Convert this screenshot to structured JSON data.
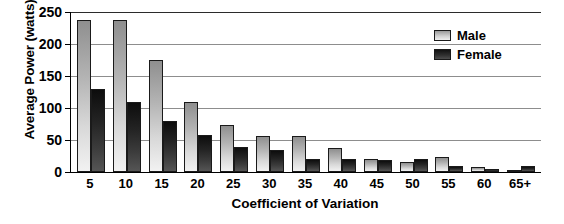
{
  "chart_data": {
    "type": "bar",
    "title": "",
    "xlabel": "Coefficient of Variation",
    "ylabel": "Average Power (watts)",
    "categories": [
      "5",
      "10",
      "15",
      "20",
      "25",
      "30",
      "35",
      "40",
      "45",
      "50",
      "55",
      "60",
      "65+"
    ],
    "series": [
      {
        "name": "Male",
        "color": "#cccccc",
        "values": [
          238,
          238,
          175,
          110,
          73,
          56,
          57,
          37,
          20,
          16,
          23,
          8,
          3
        ]
      },
      {
        "name": "Female",
        "color": "#262626",
        "values": [
          130,
          110,
          79,
          58,
          39,
          34,
          21,
          21,
          18,
          21,
          9,
          5,
          9
        ]
      }
    ],
    "ylim": [
      0,
      250
    ],
    "yticks": [
      0,
      50,
      100,
      150,
      200,
      250
    ],
    "ytick_labels": [
      "0",
      "50",
      "100",
      "150",
      "200",
      "250"
    ],
    "grid": true,
    "grid_axis": "y",
    "legend_position": "top-right",
    "bar_style": "grouped"
  }
}
